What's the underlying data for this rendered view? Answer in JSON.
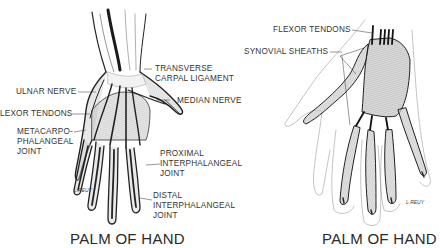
{
  "left_figure": {
    "caption": "PALM OF HAND",
    "signature": "L.REUY",
    "labels": {
      "transverse_carpal_ligament_1": "TRANSVERSE",
      "transverse_carpal_ligament_2": "CARPAL LIGAMENT",
      "ulnar_nerve": "ULNAR NERVE",
      "median_nerve": "MEDIAN NERVE",
      "flexor_tendons": "LEXOR TENDONS",
      "metacarpophalangeal_1": "METACARPO-",
      "metacarpophalangeal_2": "PHALANGEAL",
      "metacarpophalangeal_3": "JOINT",
      "proximal_1": "PROXIMAL",
      "proximal_2": "INTERPHALANGEAL",
      "proximal_3": "JOINT",
      "distal_1": "DISTAL",
      "distal_2": "INTERPHALANGEAL",
      "distal_3": "JOINT"
    }
  },
  "right_figure": {
    "caption": "PALM OF HAND",
    "signature": "L.REUY",
    "labels": {
      "flexor_tendons": "FLEXOR TENDONS",
      "synovial_sheaths": "SYNOVIAL SHEATHS"
    }
  }
}
